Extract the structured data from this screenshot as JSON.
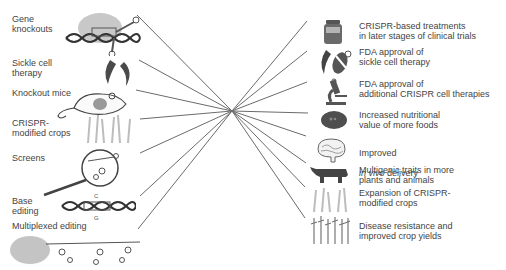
{
  "diagram": {
    "center": {
      "x": 232,
      "y": 111
    },
    "line_color": "#6b6b6b",
    "left": {
      "items": [
        {
          "label": "Gene\nknockouts",
          "icon": "crispr-complex-dna-icon",
          "line_end": {
            "x": 137,
            "y": 15
          }
        },
        {
          "label": "Sickle cell\ntherapy",
          "icon": "sickle-cells-icon",
          "line_end": {
            "x": 139,
            "y": 60
          }
        },
        {
          "label": "Knockout mice",
          "icon": "mouse-icon",
          "line_end": {
            "x": 136,
            "y": 90
          }
        },
        {
          "label": "CRISPR-\nmodified crops",
          "icon": "crops-icon",
          "line_end": {
            "x": 140,
            "y": 119
          }
        },
        {
          "label": "Screens",
          "icon": "magnifier-guide-rna-icon",
          "line_end": {
            "x": 140,
            "y": 153
          }
        },
        {
          "label": "Base\nediting",
          "icon": "dna-base-edit-icon",
          "line_end": {
            "x": 140,
            "y": 196
          }
        },
        {
          "label": "Multiplexed editing",
          "icon": "multiplex-guide-rna-icon",
          "line_end": {
            "x": 138,
            "y": 229
          }
        }
      ]
    },
    "right": {
      "items": [
        {
          "label": "CRISPR-based treatments\nin later stages of clinical trials",
          "icon": "medicine-jar-icon",
          "line_end": {
            "x": 307,
            "y": 21
          }
        },
        {
          "label": "FDA approval of\nsickle cell therapy",
          "icon": "sickle-cells-approved-icon",
          "line_end": {
            "x": 307,
            "y": 51
          }
        },
        {
          "label": "FDA approval of\nadditional CRISPR cell therapies",
          "icon": "microscope-icon",
          "line_end": {
            "x": 307,
            "y": 82
          }
        },
        {
          "label": "Increased nutritional\nvalue of more foods",
          "icon": "tomato-icon",
          "line_end": {
            "x": 308,
            "y": 113
          }
        },
        {
          "label_plain": "Improved",
          "label_italic": "in vivo",
          "label_rest": " delivery",
          "icon": "brain-icon",
          "line_end": {
            "x": 306,
            "y": 136
          }
        },
        {
          "label": "Multigenic traits in more\nplants and animals",
          "icon": "cow-icon",
          "line_end": {
            "x": 306,
            "y": 163
          }
        },
        {
          "label": "Expansion of CRISPR-\nmodified crops",
          "icon": "crops-icon",
          "line_end": {
            "x": 305,
            "y": 187
          }
        },
        {
          "label": "Disease resistance and\nimproved crop yields",
          "icon": "wheat-field-icon",
          "line_end": {
            "x": 305,
            "y": 218
          }
        }
      ]
    }
  }
}
